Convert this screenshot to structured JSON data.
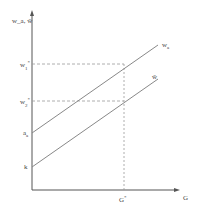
{
  "axes": {
    "y_label": "w_a, ŵ",
    "x_label": "G"
  },
  "labels": {
    "w1_star": "w",
    "w1_sub": "1",
    "w1_sup": "*",
    "w2_star": "w",
    "w2_sub": "2",
    "w2_sup": "*",
    "a_intercept": "a",
    "a_sub": "a",
    "k_intercept": "k",
    "g_star": "G",
    "g_star_sup": "*",
    "line_wa": "w",
    "line_wa_sub": "a",
    "line_what": "ŵ"
  },
  "colors": {
    "axis": "#555555",
    "line": "#888888",
    "dashed": "#999999"
  }
}
